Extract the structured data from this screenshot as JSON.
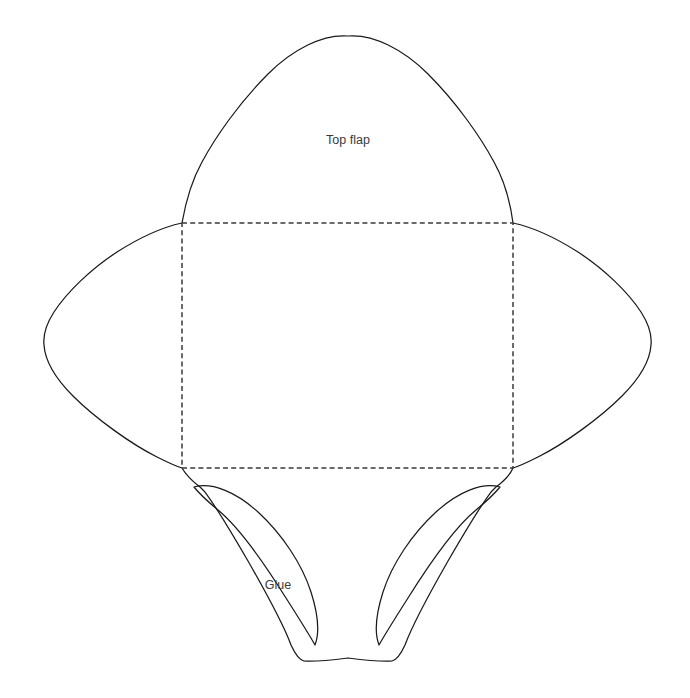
{
  "document": {
    "title": "Envelope template dieline",
    "background_color": "#ffffff",
    "cut_line_color": "#1a1a1a",
    "fold_line_color": "#3a3a3a",
    "label_color": "#3b3b3b",
    "width": 690,
    "height": 698
  },
  "labels": {
    "top_flap": "Top flap",
    "glue": "Glue"
  },
  "geometry": {
    "fold_rectangle": {
      "left": 182,
      "top": 223,
      "right": 513,
      "bottom": 468,
      "width": 331,
      "height": 245,
      "dash": "5 3.2"
    },
    "top_flap": {
      "apex_x": 348,
      "apex_y": 36,
      "base_left_x": 182,
      "base_right_x": 513,
      "base_y": 223
    },
    "left_flap": {
      "tip_x": 40,
      "top_y": 290,
      "bottom_y": 355
    },
    "right_flap": {
      "tip_x": 651,
      "peak_y": 340
    },
    "glue_flap_left": {
      "top_x": 194,
      "top_y": 487,
      "tip_x": 315,
      "tip_y": 645
    },
    "glue_flap_right": {
      "top_x": 500,
      "top_y": 487,
      "tip_x": 405,
      "tip_y": 645
    },
    "bottom_edge": {
      "center_x": 348,
      "center_y": 658
    }
  },
  "label_positions": {
    "top_flap": {
      "x": 348,
      "y": 141
    },
    "glue": {
      "x": 278,
      "y": 586
    }
  },
  "paths": {
    "outline": "M 182,223 C 186,200 192,180 202,162 C 216,136 240,102 268,74 C 292,50 322,34 348,36 C 374,34 404,50 428,74 C 456,102 480,136 494,162 C 504,180 510,200 513,223 C 536,228 556,238 578,252 C 604,269 628,292 641,312 C 650,326 652,336 651,345 C 650,360 640,378 622,396 C 600,418 564,444 538,457 C 528,462 520,466 513,468 C 510,475 504,481 496,487 C 494,489 493,490 491,492 C 482,504 466,530 448,561 C 428,596 412,626 405,645 C 400,656 396,660 392,661 C 380,662 364,660 348,658 C 332,660 316,662 304,661 C 300,660 296,656 291,645 C 284,626 268,596 248,561 C 230,530 214,504 205,492 C 203,490 202,489 200,487 C 192,481 186,475 182,468 C 175,466 167,462 157,457 C 131,444 95,418 73,396 C 55,378 45,360 44,345 C 43,336 45,326 54,312 C 67,292 91,269 117,252 C 139,238 159,228 182,223 Z",
    "glue_left": "M 194,487 C 212,482 236,492 258,512 C 282,534 302,564 311,592 C 318,614 320,632 315,645 C 310,636 300,620 286,598 C 266,566 240,528 218,510 C 206,500 198,492 194,487 Z",
    "glue_right": "M 500,487 C 482,482 458,492 436,512 C 412,534 392,564 383,592 C 376,614 374,632 379,645 C 384,636 394,620 408,598 C 428,566 454,528 476,510 C 488,500 496,492 500,487 Z",
    "fold_rect": "M 182,223 L 513,223 L 513,468 L 182,468 Z"
  }
}
